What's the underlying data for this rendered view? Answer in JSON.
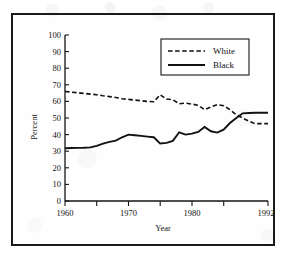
{
  "figure": {
    "border_color": "#1a1a1a",
    "background": "#fefefe"
  },
  "chart_data": {
    "type": "line",
    "title": "",
    "xlabel": "Year",
    "ylabel": "Percent",
    "xlim": [
      1960,
      1992
    ],
    "ylim": [
      0,
      100
    ],
    "grid": false,
    "legend_position": "top-right",
    "x_major_ticks": [
      1960,
      1970,
      1980,
      1992
    ],
    "x_minor_ticks": [
      1965,
      1975,
      1985
    ],
    "x_tick_labels": [
      "1960",
      "1970",
      "1980",
      "1992"
    ],
    "y_ticks": [
      0,
      10,
      20,
      30,
      40,
      50,
      60,
      70,
      80,
      90,
      100
    ],
    "y_tick_labels": [
      "0",
      "10",
      "20",
      "30",
      "40",
      "50",
      "60",
      "70",
      "80",
      "90",
      "100"
    ],
    "x": [
      1960,
      1961,
      1962,
      1963,
      1964,
      1965,
      1966,
      1967,
      1968,
      1969,
      1970,
      1971,
      1972,
      1973,
      1974,
      1975,
      1976,
      1977,
      1978,
      1979,
      1980,
      1981,
      1982,
      1983,
      1984,
      1985,
      1986,
      1987,
      1988,
      1989,
      1990,
      1991,
      1992
    ],
    "series": [
      {
        "name": "White",
        "style": "dashed",
        "color": "#111111",
        "values": [
          66.0,
          65.6,
          65.2,
          64.8,
          64.4,
          64.0,
          63.4,
          62.9,
          62.4,
          61.6,
          61.2,
          60.8,
          60.4,
          60.0,
          59.8,
          64.0,
          61.4,
          61.0,
          58.6,
          59.0,
          58.4,
          57.6,
          55.0,
          56.6,
          58.0,
          57.4,
          55.0,
          52.0,
          50.0,
          48.0,
          46.6,
          46.6,
          46.6
        ]
      },
      {
        "name": "Black",
        "style": "solid",
        "color": "#111111",
        "values": [
          31.8,
          31.9,
          32.0,
          32.1,
          32.3,
          33.2,
          34.6,
          35.6,
          36.4,
          38.4,
          40.0,
          39.6,
          39.2,
          38.8,
          38.4,
          34.6,
          35.0,
          36.2,
          41.4,
          40.0,
          40.6,
          41.6,
          44.6,
          42.0,
          41.2,
          43.0,
          47.0,
          50.0,
          52.8,
          53.0,
          53.2,
          53.2,
          53.2
        ]
      }
    ]
  },
  "legend": {
    "entries": [
      {
        "label": "White",
        "style": "dashed"
      },
      {
        "label": "Black",
        "style": "solid"
      }
    ]
  }
}
